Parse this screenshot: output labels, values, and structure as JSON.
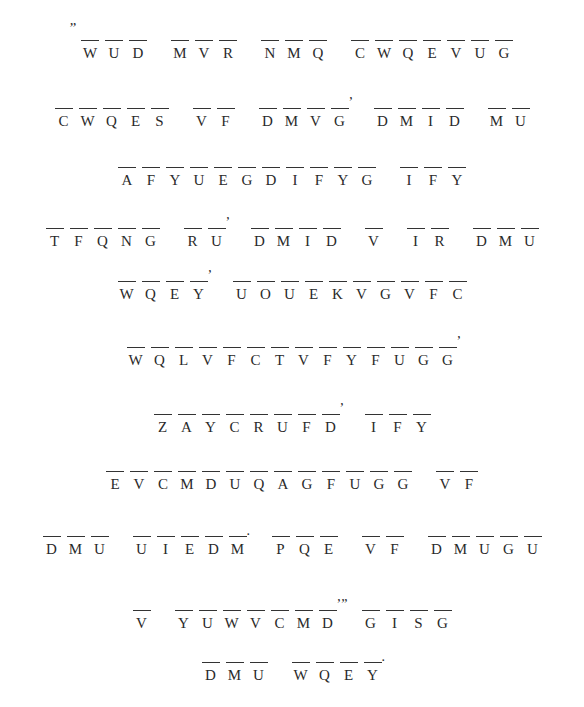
{
  "puzzle": {
    "type": "cryptogram",
    "lines": [
      {
        "top": 40,
        "words": [
          {
            "lead": "”",
            "letters": [
              "W",
              "U",
              "D"
            ]
          },
          {
            "letters": [
              "M",
              "V",
              "R"
            ]
          },
          {
            "letters": [
              "N",
              "M",
              "Q"
            ]
          },
          {
            "letters": [
              "C",
              "W",
              "Q",
              "E",
              "V",
              "U",
              "G"
            ]
          }
        ]
      },
      {
        "top": 108,
        "words": [
          {
            "letters": [
              "C",
              "W",
              "Q",
              "E",
              "S"
            ]
          },
          {
            "letters": [
              "V",
              "F"
            ]
          },
          {
            "letters": [
              "D",
              "M",
              "V",
              "G"
            ],
            "trail": "’"
          },
          {
            "letters": [
              "D",
              "M",
              "I",
              "D"
            ]
          },
          {
            "letters": [
              "M",
              "U"
            ]
          }
        ]
      },
      {
        "top": 167,
        "words": [
          {
            "letters": [
              "A",
              "F",
              "Y",
              "U",
              "E",
              "G",
              "D",
              "I",
              "F",
              "Y",
              "G"
            ]
          },
          {
            "letters": [
              "I",
              "F",
              "Y"
            ]
          }
        ]
      },
      {
        "top": 228,
        "words": [
          {
            "letters": [
              "T",
              "F",
              "Q",
              "N",
              "G"
            ]
          },
          {
            "letters": [
              "R",
              "U"
            ],
            "trail": "’"
          },
          {
            "letters": [
              "D",
              "M",
              "I",
              "D"
            ]
          },
          {
            "letters": [
              "V"
            ]
          },
          {
            "letters": [
              "I",
              "R"
            ]
          },
          {
            "letters": [
              "D",
              "M",
              "U"
            ]
          }
        ]
      },
      {
        "top": 281,
        "words": [
          {
            "letters": [
              "W",
              "Q",
              "E",
              "Y"
            ],
            "trail": "’"
          },
          {
            "letters": [
              "U",
              "O",
              "U",
              "E",
              "K",
              "V",
              "G",
              "V",
              "F",
              "C"
            ]
          }
        ]
      },
      {
        "top": 347,
        "words": [
          {
            "letters": [
              "W",
              "Q",
              "L",
              "V",
              "F",
              "C",
              "T",
              "V",
              "F",
              "Y",
              "F",
              "U",
              "G",
              "G"
            ],
            "trail": "’"
          }
        ]
      },
      {
        "top": 414,
        "words": [
          {
            "letters": [
              "Z",
              "A",
              "Y",
              "C",
              "R",
              "U",
              "F",
              "D"
            ],
            "trail": "’"
          },
          {
            "letters": [
              "I",
              "F",
              "Y"
            ]
          }
        ]
      },
      {
        "top": 471,
        "words": [
          {
            "letters": [
              "E",
              "V",
              "C",
              "M",
              "D",
              "U",
              "Q",
              "A",
              "G",
              "F",
              "U",
              "G",
              "G"
            ]
          },
          {
            "letters": [
              "V",
              "F"
            ]
          }
        ]
      },
      {
        "top": 536,
        "words": [
          {
            "letters": [
              "D",
              "M",
              "U"
            ]
          },
          {
            "letters": [
              "U",
              "I",
              "E",
              "D",
              "M"
            ],
            "trail": "."
          },
          {
            "letters": [
              "P",
              "Q",
              "E"
            ]
          },
          {
            "letters": [
              "V",
              "F"
            ]
          },
          {
            "letters": [
              "D",
              "M",
              "U",
              "G",
              "U"
            ]
          }
        ]
      },
      {
        "top": 610,
        "words": [
          {
            "letters": [
              "V"
            ]
          },
          {
            "letters": [
              "Y",
              "U",
              "W",
              "V",
              "C",
              "M",
              "D"
            ],
            "trail": "’”"
          },
          {
            "letters": [
              "G",
              "I",
              "S",
              "G"
            ]
          }
        ]
      },
      {
        "top": 662,
        "words": [
          {
            "letters": [
              "D",
              "M",
              "U"
            ]
          },
          {
            "letters": [
              "W",
              "Q",
              "E",
              "Y"
            ],
            "trail": "."
          }
        ]
      }
    ]
  }
}
